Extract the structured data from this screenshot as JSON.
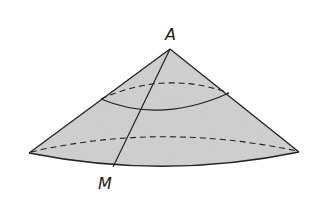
{
  "diagram": {
    "type": "cone-sector-surface",
    "labels": {
      "apex": "A",
      "base_point": "M"
    },
    "colors": {
      "fill": "#c8c8c8",
      "stroke": "#222222",
      "background": "#ffffff"
    },
    "elements": [
      "cone lateral surface (shaded)",
      "generator line AM",
      "upper solid arc (front) with dashed back arc",
      "lower dashed arc (back of base)",
      "base front arc (solid)"
    ]
  }
}
